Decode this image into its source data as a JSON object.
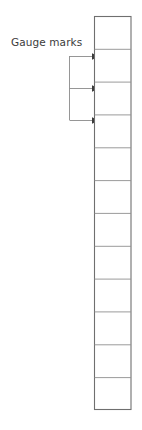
{
  "diagram": {
    "type": "technical-line-diagram",
    "canvas": {
      "width": 142,
      "height": 430
    },
    "background_color": "#ffffff",
    "annotations": [
      {
        "id": "gauge-marks",
        "label": "Gauge marks",
        "label_color": "#3b3b3b",
        "label_position": {
          "x": 11,
          "y": 36
        },
        "leader": {
          "color": "#8a8a8a",
          "stroke_width": 0.9,
          "stem_x": 69,
          "stem_top_y": 56,
          "stem_bottom_y": 120,
          "arrow_color": "#3a3a3a",
          "arrows": [
            {
              "from_x": 69,
              "to_x": 95,
              "y": 56
            },
            {
              "from_x": 69,
              "to_x": 95,
              "y": 88
            },
            {
              "from_x": 69,
              "to_x": 95,
              "y": 120
            }
          ]
        }
      }
    ],
    "column": {
      "name": "segmented-column",
      "left_x": 94,
      "right_x": 131,
      "top_y": 16,
      "bottom_y": 410,
      "cell_count": 12,
      "cell_height": 32.8,
      "outline_color": "#6f6f6f",
      "outline_width": 1.1,
      "divider_color": "#8f8f8f",
      "divider_width": 0.9,
      "fill_color": "#ffffff",
      "divider_y_values": [
        48.8,
        81.7,
        114.5,
        147.3,
        180.2,
        213.0,
        245.8,
        278.7,
        311.5,
        344.3,
        377.2
      ],
      "marked_divider_y_values": [
        56,
        88,
        120
      ]
    }
  }
}
